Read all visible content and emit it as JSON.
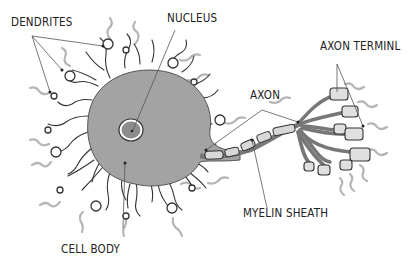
{
  "labels": {
    "dendrites": "DENDRITES",
    "nucleus": "NUCLEUS",
    "axon_terminal": "AXON TERMINL",
    "axon": "AXON",
    "myelin_sheath": "MYELIN SHEATH",
    "cell_body": "CELL BODY"
  },
  "colors": {
    "cell_body": "#a3a3a3",
    "outline": "#333333",
    "nucleus": "#8c8c8c",
    "myelin": "#d8d8d8",
    "signal_arrow": "#b5b5b5",
    "leader_line": "#555555"
  }
}
